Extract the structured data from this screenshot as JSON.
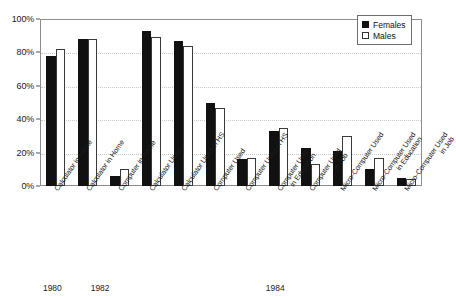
{
  "chart_data": {
    "type": "bar",
    "title": "",
    "subtitle": "",
    "xlabel": "",
    "ylabel": "",
    "ylim": [
      0,
      100
    ],
    "yticks": [
      "0%",
      "20%",
      "40%",
      "60%",
      "80%",
      "100%"
    ],
    "ytick_values": [
      0,
      20,
      40,
      60,
      80,
      100
    ],
    "grid": "horizontal-dotted",
    "legend_position": "top-right",
    "categories": [
      "Calculator in Home",
      "Calculator in Home",
      "Computer in Home",
      "Calculator Used",
      "Calculator Used in HS",
      "Computer Used",
      "Computer Used in HS",
      "Computer Used in Education",
      "Computer Used in Job",
      "Micro-Computer Used",
      "Micro-Computer Used in Education",
      "Micro-Computer Used in Job"
    ],
    "category_lines": [
      [
        "Calculator in Home",
        ""
      ],
      [
        "Calculator in Home",
        ""
      ],
      [
        "Computer in Home",
        ""
      ],
      [
        "Calculator Used",
        ""
      ],
      [
        "Calculator Used in HS",
        ""
      ],
      [
        "Computer Used",
        ""
      ],
      [
        "Computer Used in HS",
        ""
      ],
      [
        "Computer Used",
        "in Education"
      ],
      [
        "Computer Used",
        "in Job"
      ],
      [
        "Micro-Computer Used",
        ""
      ],
      [
        "Micro-Computer Used",
        "in Education"
      ],
      [
        "Micro-Computer Used",
        "in Job"
      ]
    ],
    "series": [
      {
        "name": "Females",
        "color": "#111111",
        "values": [
          78,
          88,
          6,
          93,
          87,
          50,
          16,
          33,
          23,
          21,
          10,
          5
        ]
      },
      {
        "name": "Males",
        "color": "#ffffff",
        "values": [
          82,
          88,
          10,
          89,
          84,
          47,
          17,
          35,
          13,
          30,
          17,
          4
        ]
      }
    ],
    "group_labels": [
      {
        "text": "1980",
        "span": [
          0,
          0
        ]
      },
      {
        "text": "1982",
        "span": [
          1,
          2
        ]
      },
      {
        "text": "1984",
        "span": [
          3,
          11
        ]
      }
    ]
  },
  "legend": {
    "items": [
      {
        "label": "Females",
        "swatch": "filled-square"
      },
      {
        "label": "Males",
        "swatch": "empty-square"
      }
    ]
  }
}
